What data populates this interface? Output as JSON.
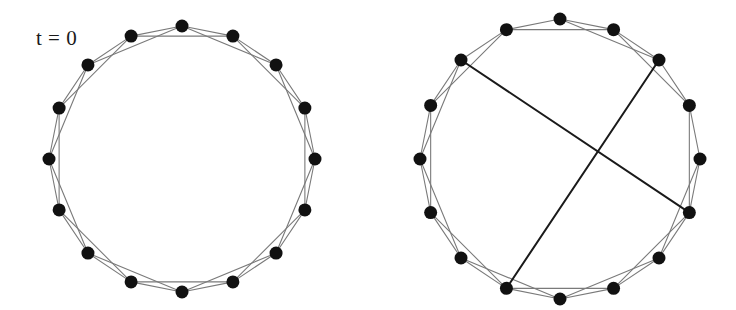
{
  "figure": {
    "type": "diagram",
    "background_color": "#ffffff",
    "width": 736,
    "height": 310
  },
  "style": {
    "node_color": "#111111",
    "node_radius": 6.5,
    "lattice_edge_color": "#7a7a7a",
    "lattice_edge_width": 1.1,
    "rewired_edge_color": "#1a1a1a",
    "rewired_edge_width": 2.0
  },
  "panels": [
    {
      "id": "left-panel",
      "name": "regular-ring-lattice",
      "label": "t = 0",
      "label_x": 36,
      "label_y": 26,
      "center_x": 182,
      "center_y": 159,
      "radius": 133,
      "node_count": 16,
      "start_angle_deg": -90,
      "neighbor_offsets": [
        1,
        2
      ],
      "rewired_edges": []
    },
    {
      "id": "right-panel",
      "name": "rewired-small-world-network",
      "label": "",
      "label_x": 0,
      "label_y": 0,
      "center_x": 560,
      "center_y": 159,
      "radius": 140,
      "node_count": 16,
      "start_angle_deg": -90,
      "neighbor_offsets": [
        1,
        2
      ],
      "rewired_edges": [
        {
          "from": 14,
          "to": 5,
          "removed_from": 14,
          "removed_to": 16
        },
        {
          "from": 2,
          "to": 9,
          "removed_from": 2,
          "removed_to": 4
        }
      ]
    }
  ],
  "chart_data": {
    "type": "diagram",
    "annotations": [
      "t = 0"
    ],
    "node_counts": [
      16,
      16
    ],
    "panel_names": [
      "regular ring lattice",
      "rewired network with two long-range chords"
    ],
    "rewired_chord_count": 2
  }
}
